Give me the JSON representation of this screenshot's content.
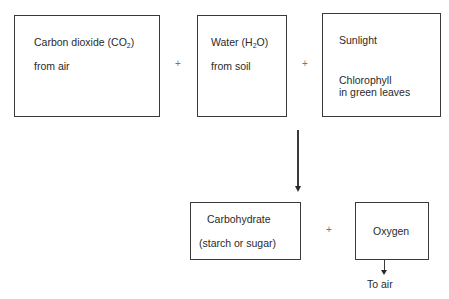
{
  "diagram": {
    "title": "",
    "inputs": [
      {
        "id": "co2",
        "line1_prefix": "Carbon dioxide (CO",
        "line1_sub": "2",
        "line1_suffix": ")",
        "line2": "from air"
      },
      {
        "id": "water",
        "line1_prefix": "Water (H",
        "line1_sub": "2",
        "line1_suffix": "O)",
        "line2": "from soil"
      },
      {
        "id": "energy",
        "line1": "Sunlight",
        "line2": "Chlorophyll",
        "line3": "in green leaves"
      }
    ],
    "operators": {
      "plus1": "+",
      "plus2": "+",
      "plus3": "+"
    },
    "outputs": [
      {
        "id": "carbohydrate",
        "line1": "Carbohydrate",
        "line2": "(starch or sugar)"
      },
      {
        "id": "oxygen",
        "line1": "Oxygen",
        "destination": "To air"
      }
    ],
    "edges": [
      {
        "from": "inputs",
        "to": "outputs",
        "type": "arrow"
      },
      {
        "from": "oxygen",
        "to": "To air",
        "type": "arrow"
      }
    ]
  }
}
